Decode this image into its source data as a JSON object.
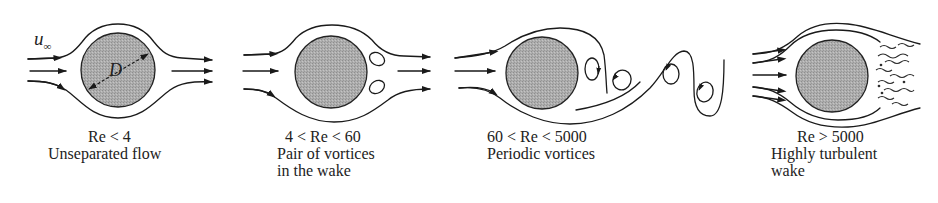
{
  "figure": {
    "colors": {
      "cylinder_fill": "#a9a9a9",
      "stroke": "#1a1a1a",
      "text": "#222222",
      "background": "#ffffff"
    },
    "symbols": {
      "freestream_velocity": "u",
      "freestream_subscript": "∞",
      "diameter": "D"
    },
    "panels": [
      {
        "id": "unseparated",
        "regime": "Re < 4",
        "description_lines": [
          "Unseparated flow"
        ]
      },
      {
        "id": "vortex-pair",
        "regime": "4 < Re < 60",
        "description_lines": [
          "Pair of vortices",
          "in the wake"
        ]
      },
      {
        "id": "periodic",
        "regime": "60 < Re < 5000",
        "description_lines": [
          "Periodic vortices"
        ]
      },
      {
        "id": "turbulent",
        "regime": "Re > 5000",
        "description_lines": [
          "Highly turbulent",
          "wake"
        ]
      }
    ]
  }
}
